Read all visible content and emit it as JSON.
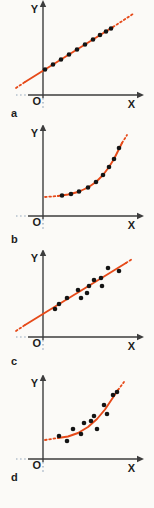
{
  "figure": {
    "background": "#fbfaf7",
    "panel_labels": [
      "a",
      "b",
      "c",
      "d"
    ]
  },
  "colors": {
    "fit": "#e64a19",
    "axis": "#3d3d3d",
    "point": "#141414",
    "ext_dotted": "#8fa3b8",
    "label": "#1d1d1d"
  },
  "chart_data": [
    {
      "id": "a",
      "type": "scatter",
      "panel_label": "a",
      "title": "",
      "xlabel": "X",
      "ylabel": "Y",
      "origin_label": "O",
      "fit_shape": "line",
      "grid": false,
      "axis_ticks": "none",
      "size": {
        "w": 154,
        "h": 125
      },
      "axes": {
        "y_x": 43,
        "x_y": 95,
        "x_from": 28,
        "x_to": 138,
        "y_from": 6,
        "x_ext": [
          16,
          27
        ],
        "y_ext": [
          98,
          108
        ]
      },
      "fit_path": {
        "solid": [
          [
            25,
            82
          ],
          [
            113,
            27
          ]
        ],
        "dotted_start": [
          [
            16,
            88
          ],
          [
            25,
            82
          ]
        ],
        "dotted_end": [
          [
            113,
            27
          ],
          [
            133,
            14
          ]
        ]
      },
      "points": [
        [
          45,
          69.5
        ],
        [
          53,
          64.5
        ],
        [
          61,
          59.5
        ],
        [
          69,
          54.5
        ],
        [
          77,
          49.5
        ],
        [
          85,
          44.5
        ],
        [
          93,
          39.5
        ],
        [
          100,
          35
        ],
        [
          106,
          31.5
        ],
        [
          111,
          28.5
        ]
      ],
      "label_pos": [
        11,
        117
      ]
    },
    {
      "id": "b",
      "type": "scatter",
      "panel_label": "b",
      "title": "",
      "xlabel": "X",
      "ylabel": "Y",
      "origin_label": "O",
      "fit_shape": "curve",
      "grid": false,
      "axis_ticks": "none",
      "size": {
        "w": 154,
        "h": 125
      },
      "axes": {
        "y_x": 43,
        "x_y": 91,
        "x_from": 28,
        "x_to": 138,
        "y_from": 5,
        "x_ext": [
          16,
          27
        ],
        "y_ext": [
          94,
          104
        ]
      },
      "fit_path": {
        "solid": [
          [
            58,
            71
          ],
          [
            68,
            69.5
          ],
          [
            78,
            67
          ],
          [
            88,
            62.5
          ],
          [
            96,
            57
          ],
          [
            103,
            50
          ],
          [
            109,
            42
          ],
          [
            114,
            34
          ],
          [
            118,
            26
          ],
          [
            122,
            18
          ]
        ],
        "dotted_start": [
          [
            45,
            72
          ],
          [
            58,
            71
          ]
        ],
        "dotted_end": [
          [
            122,
            18
          ],
          [
            127,
            10
          ]
        ]
      },
      "points": [
        [
          62,
          70.5
        ],
        [
          71,
          69
        ],
        [
          79,
          66.5
        ],
        [
          88,
          62.5
        ],
        [
          96,
          57
        ],
        [
          103,
          50
        ],
        [
          109,
          42
        ],
        [
          114,
          34
        ],
        [
          119,
          23
        ]
      ],
      "label_pos": [
        11,
        118
      ]
    },
    {
      "id": "c",
      "type": "scatter",
      "panel_label": "c",
      "title": "",
      "xlabel": "X",
      "ylabel": "Y",
      "origin_label": "O",
      "fit_shape": "line",
      "grid": false,
      "axis_ticks": "none",
      "size": {
        "w": 154,
        "h": 125
      },
      "axes": {
        "y_x": 43,
        "x_y": 87,
        "x_from": 28,
        "x_to": 138,
        "y_from": 5,
        "x_ext": [
          16,
          27
        ],
        "y_ext": [
          90,
          100
        ]
      },
      "fit_path": {
        "solid": [
          [
            25,
            75
          ],
          [
            126,
            13
          ]
        ],
        "dotted_start": [
          [
            16,
            81
          ],
          [
            25,
            75
          ]
        ],
        "dotted_end": [
          [
            126,
            13
          ],
          [
            133,
            8.5
          ]
        ]
      },
      "points": [
        [
          55,
          59
        ],
        [
          59,
          54
        ],
        [
          67,
          48
        ],
        [
          78,
          40
        ],
        [
          81,
          48
        ],
        [
          87,
          43
        ],
        [
          89,
          36
        ],
        [
          94,
          30
        ],
        [
          101,
          28
        ],
        [
          102,
          36
        ],
        [
          108,
          18
        ],
        [
          119,
          21
        ]
      ],
      "label_pos": [
        11,
        115
      ]
    },
    {
      "id": "d",
      "type": "scatter",
      "panel_label": "d",
      "title": "",
      "xlabel": "X",
      "ylabel": "Y",
      "origin_label": "O",
      "fit_shape": "curve",
      "grid": false,
      "axis_ticks": "none",
      "size": {
        "w": 154,
        "h": 133
      },
      "axes": {
        "y_x": 43,
        "x_y": 84,
        "x_from": 28,
        "x_to": 138,
        "y_from": 5,
        "x_ext": [
          16,
          27
        ],
        "y_ext": [
          87,
          97
        ]
      },
      "fit_path": {
        "solid": [
          [
            58,
            63
          ],
          [
            68,
            61.5
          ],
          [
            78,
            58
          ],
          [
            88,
            52
          ],
          [
            97,
            44
          ],
          [
            105,
            34.5
          ],
          [
            112,
            24
          ],
          [
            118,
            15
          ]
        ],
        "dotted_start": [
          [
            45,
            65
          ],
          [
            58,
            63
          ]
        ],
        "dotted_end": [
          [
            118,
            15
          ],
          [
            124,
            7
          ]
        ]
      },
      "points": [
        [
          59,
          61
        ],
        [
          67,
          66
        ],
        [
          73,
          54
        ],
        [
          81,
          59
        ],
        [
          84,
          48
        ],
        [
          91,
          46
        ],
        [
          94,
          41
        ],
        [
          97,
          54
        ],
        [
          104,
          30
        ],
        [
          107,
          39
        ],
        [
          113,
          20
        ],
        [
          117,
          17
        ]
      ],
      "label_pos": [
        11,
        106
      ]
    }
  ]
}
